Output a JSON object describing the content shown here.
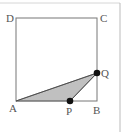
{
  "diagram": {
    "type": "geometry",
    "colors": {
      "line": "#777777",
      "frame": "#cccccc",
      "fill": "#c0c0c0",
      "point": "#111111",
      "label": "#555555"
    },
    "square": {
      "vertices": [
        "A",
        "B",
        "C",
        "D"
      ]
    },
    "labels": {
      "A": "A",
      "B": "B",
      "C": "C",
      "D": "D",
      "P": "P",
      "Q": "Q"
    },
    "points": {
      "A": {
        "x": 16,
        "y": 101
      },
      "B": {
        "x": 97,
        "y": 101
      },
      "C": {
        "x": 97,
        "y": 18
      },
      "D": {
        "x": 16,
        "y": 18
      },
      "P": {
        "x": 70,
        "y": 101
      },
      "Q": {
        "x": 97,
        "y": 73
      }
    },
    "shaded_triangle": [
      "A",
      "P",
      "Q"
    ],
    "moving_points": [
      "P",
      "Q"
    ]
  }
}
